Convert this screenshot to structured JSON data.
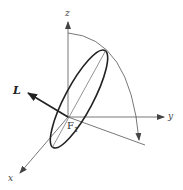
{
  "diagram": {
    "type": "3d-orbit-orientation",
    "axes": {
      "x": {
        "label": "x"
      },
      "y": {
        "label": "y"
      },
      "z": {
        "label": "z"
      }
    },
    "vector": {
      "label": "L"
    },
    "focus": {
      "label": "F",
      "subscript": "1"
    },
    "colors": {
      "axis": "#555555",
      "ellipse": "#222222",
      "vector": "#222222",
      "background": "#ffffff"
    }
  }
}
